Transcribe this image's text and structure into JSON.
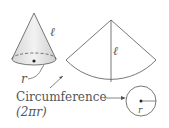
{
  "diagram": {
    "title": "",
    "labels": {
      "slant_cone": "ℓ",
      "slant_sector": "ℓ",
      "radius_cone": "r",
      "radius_base": "r",
      "circumference": "Circumference",
      "circumference_formula": "(2πr)"
    },
    "colors": {
      "stroke": "#555555",
      "cone_fill": "#e8e8e8",
      "cone_shade": "#cfcfcf",
      "text": "#555555"
    }
  }
}
